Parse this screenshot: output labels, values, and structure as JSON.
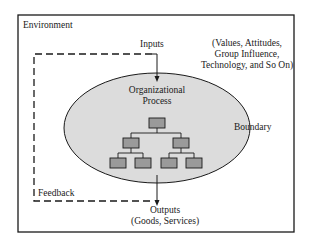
{
  "diagram": {
    "environment_label": "Environment",
    "inputs_label": "Inputs",
    "inputs_examples": [
      "(Values, Attitudes,",
      "Group Influence,",
      "Technology, and So On)"
    ],
    "process_label": [
      "Organizational",
      "Process"
    ],
    "boundary_label": "Boundary",
    "feedback_label": "Feedback",
    "outputs_label": "Outputs",
    "outputs_examples": "(Goods, Services)",
    "colors": {
      "ellipse_fill": "#dcdcdc",
      "box_fill": "#9a9a9a",
      "stroke": "#1a1a1a"
    }
  }
}
